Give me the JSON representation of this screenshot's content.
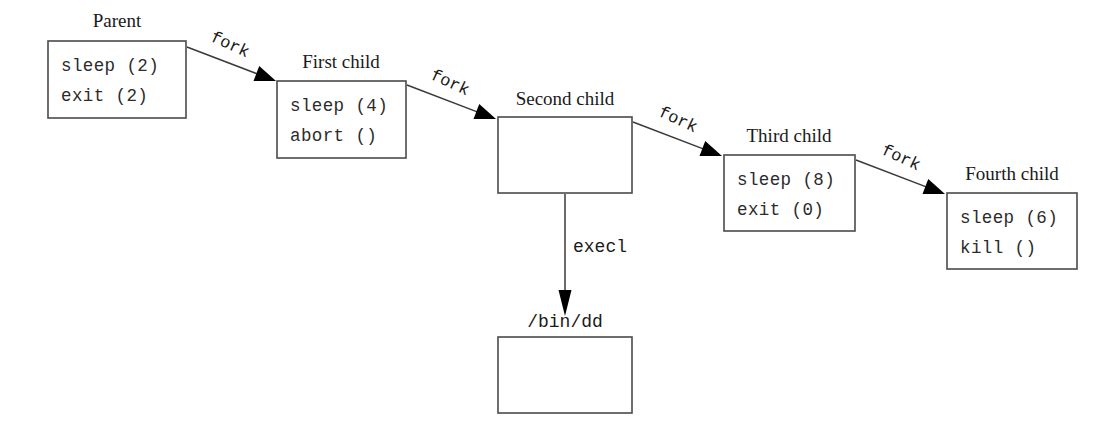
{
  "diagram": {
    "type": "process-tree-flow",
    "background_color": "#ffffff",
    "box_border_color": "#4a4a4a",
    "arrow_color": "#000000",
    "nodes": [
      {
        "id": "parent",
        "title": "Parent",
        "lines": [
          "sleep (2)",
          "exit (2)"
        ],
        "x": 48,
        "y": 41,
        "w": 138,
        "h": 77,
        "title_x": 117,
        "title_y": 27
      },
      {
        "id": "first-child",
        "title": "First child",
        "lines": [
          "sleep (4)",
          "abort ()"
        ],
        "x": 277,
        "y": 81,
        "w": 129,
        "h": 77,
        "title_x": 341,
        "title_y": 68
      },
      {
        "id": "second-child",
        "title": "Second child",
        "lines": [],
        "x": 498,
        "y": 117,
        "w": 134,
        "h": 76,
        "title_x": 565,
        "title_y": 105
      },
      {
        "id": "third-child",
        "title": "Third child",
        "lines": [
          "sleep (8)",
          "exit (0)"
        ],
        "x": 724,
        "y": 155,
        "w": 131,
        "h": 76,
        "title_x": 789,
        "title_y": 142
      },
      {
        "id": "fourth-child",
        "title": "Fourth child",
        "lines": [
          "sleep (6)",
          "kill ()"
        ],
        "x": 947,
        "y": 193,
        "w": 130,
        "h": 76,
        "title_x": 1012,
        "title_y": 180
      },
      {
        "id": "bin-dd",
        "title": "/bin/dd",
        "lines": [],
        "x": 498,
        "y": 337,
        "w": 134,
        "h": 76,
        "title_x": 565,
        "title_y": 327
      }
    ],
    "edges": [
      {
        "id": "fork-1",
        "label": "fork",
        "from": "parent",
        "to": "first-child",
        "x1": 187,
        "y1": 47,
        "x2": 276,
        "y2": 81,
        "label_x": 228,
        "label_y": 49,
        "label_rotate": 25
      },
      {
        "id": "fork-2",
        "label": "fork",
        "from": "first-child",
        "to": "second-child",
        "x1": 407,
        "y1": 85,
        "x2": 496,
        "y2": 119,
        "label_x": 448,
        "label_y": 87,
        "label_rotate": 25
      },
      {
        "id": "fork-3",
        "label": "fork",
        "from": "second-child",
        "to": "third-child",
        "x1": 633,
        "y1": 122,
        "x2": 722,
        "y2": 156,
        "label_x": 676,
        "label_y": 124,
        "label_rotate": 25
      },
      {
        "id": "fork-4",
        "label": "fork",
        "from": "third-child",
        "to": "fourth-child",
        "x1": 856,
        "y1": 160,
        "x2": 945,
        "y2": 194,
        "label_x": 899,
        "label_y": 162,
        "label_rotate": 25
      },
      {
        "id": "execl-1",
        "label": "execl",
        "from": "second-child",
        "to": "bin-dd",
        "x1": 565,
        "y1": 194,
        "x2": 565,
        "y2": 316,
        "label_x": 600,
        "label_y": 252,
        "label_rotate": 0
      }
    ]
  }
}
